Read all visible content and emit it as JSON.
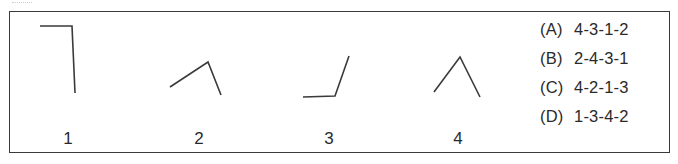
{
  "figures": [
    {
      "label": "1",
      "points": [
        [
          40,
          26
        ],
        [
          72,
          26
        ],
        [
          75,
          93
        ]
      ]
    },
    {
      "label": "2",
      "points": [
        [
          170,
          87
        ],
        [
          208,
          62
        ],
        [
          221,
          95
        ]
      ]
    },
    {
      "label": "3",
      "points": [
        [
          303,
          97
        ],
        [
          335,
          96
        ],
        [
          349,
          56
        ]
      ]
    },
    {
      "label": "4",
      "points": [
        [
          434,
          92
        ],
        [
          460,
          57
        ],
        [
          480,
          97
        ]
      ]
    }
  ],
  "options": [
    {
      "key": "(A)",
      "value": "4-3-1-2"
    },
    {
      "key": "(B)",
      "value": "2-4-3-1"
    },
    {
      "key": "(C)",
      "value": "4-2-1-3"
    },
    {
      "key": "(D)",
      "value": "1-3-4-2"
    }
  ],
  "colors": {
    "stroke": "#3a3a3a",
    "text": "#2a2a2a",
    "background": "#ffffff"
  }
}
